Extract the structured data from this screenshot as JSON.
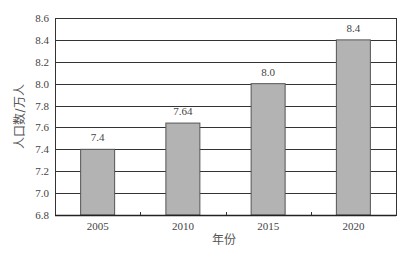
{
  "chart_data": {
    "type": "bar",
    "title": "",
    "xlabel": "年份",
    "ylabel": "人口数/万人",
    "categories": [
      "2005",
      "2010",
      "2015",
      "2020"
    ],
    "values": [
      7.4,
      7.64,
      8.0,
      8.4
    ],
    "value_labels": [
      "7.4",
      "7.64",
      "8.0",
      "8.4"
    ],
    "ylim": [
      6.8,
      8.6
    ],
    "yticks": [
      "6.8",
      "7.0",
      "7.2",
      "7.4",
      "7.6",
      "7.8",
      "8.0",
      "8.2",
      "8.4",
      "8.6"
    ],
    "grid": true,
    "legend": null,
    "colors": {
      "bar_fill": "#b3b3b3",
      "bar_border": "#555555",
      "grid": "#333333"
    }
  }
}
